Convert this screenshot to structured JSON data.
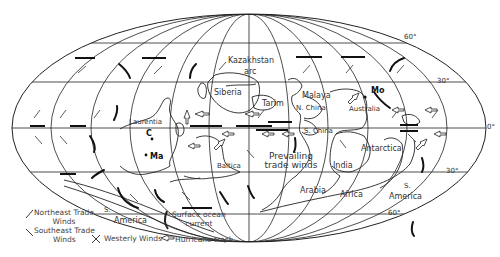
{
  "map": {
    "projection": "Mollweide",
    "latitude_labels": [
      {
        "text": "60°",
        "x": 404,
        "y": 37
      },
      {
        "text": "30°",
        "x": 438,
        "y": 76
      },
      {
        "text": "0°",
        "x": 486,
        "y": 124
      },
      {
        "text": "30°",
        "x": 446,
        "y": 168
      },
      {
        "text": "60°",
        "x": 386,
        "y": 210
      }
    ],
    "regions": [
      {
        "name": "Kazakhstan",
        "x": 231,
        "y": 60
      },
      {
        "name": "arc",
        "x": 252,
        "y": 72
      },
      {
        "name": "Siberia",
        "x": 213,
        "y": 90
      },
      {
        "name": "Tarim",
        "x": 263,
        "y": 103
      },
      {
        "name": "Malaya",
        "x": 302,
        "y": 94
      },
      {
        "name": "N. China",
        "x": 296,
        "y": 105
      },
      {
        "name": "Australia",
        "x": 348,
        "y": 104
      },
      {
        "name": "Laurentia",
        "x": 130,
        "y": 118
      },
      {
        "name": "S. China",
        "x": 305,
        "y": 126
      },
      {
        "name": "Antarctica",
        "x": 360,
        "y": 142
      },
      {
        "name": "Baltica",
        "x": 216,
        "y": 164
      },
      {
        "name": "India",
        "x": 334,
        "y": 159
      },
      {
        "name": "Arabia",
        "x": 300,
        "y": 187
      },
      {
        "name": "Africa",
        "x": 340,
        "y": 190
      },
      {
        "name": "S.",
        "x": 104,
        "y": 206
      },
      {
        "name": "America",
        "x": 114,
        "y": 217
      },
      {
        "name": "S.",
        "x": 402,
        "y": 183
      },
      {
        "name": "America",
        "x": 389,
        "y": 193
      }
    ],
    "markers": [
      {
        "label": "Mo",
        "x": 368,
        "y": 89,
        "bold": true
      },
      {
        "label": "C",
        "x": 147,
        "y": 133,
        "bold": true
      },
      {
        "label": "Ma",
        "x": 150,
        "y": 155,
        "bold": true
      }
    ],
    "annotation": {
      "line1": "Prevailing",
      "line2": "trade winds"
    }
  },
  "legend": {
    "northeast_trade": {
      "line1": "Northeast Trade",
      "line2": "Winds"
    },
    "southeast_trade": {
      "line1": "Southeast Trade",
      "line2": "Winds"
    },
    "westerly": "Westerly Winds",
    "surface_current": {
      "line1": "Surface ocean",
      "line2": "current"
    },
    "hurricane": "Hurricane track"
  },
  "colors": {
    "line": "#222222",
    "text": "#333333",
    "background": "#ffffff"
  }
}
